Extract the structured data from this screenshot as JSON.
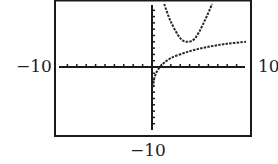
{
  "chart_data": {
    "type": "line",
    "title": "",
    "xlabel": "",
    "ylabel": "",
    "xlim": [
      -10,
      10
    ],
    "ylim": [
      -10,
      10
    ],
    "grid": false,
    "tick_spacing": 1,
    "window_labels": {
      "xmin": "−10",
      "xmax": "10",
      "ymin": "−10"
    },
    "series": [
      {
        "name": "upper curve (U-shaped, asymptotic at x=0)",
        "style": "dotted",
        "points": [
          [
            1.3,
            10
          ],
          [
            2.0,
            7.2
          ],
          [
            3.0,
            4.6
          ],
          [
            3.8,
            4.0
          ],
          [
            4.6,
            4.6
          ],
          [
            5.5,
            7.0
          ],
          [
            6.4,
            10
          ]
        ]
      },
      {
        "name": "lower curve (logarithmic)",
        "style": "dotted",
        "points": [
          [
            0.1,
            -3.2
          ],
          [
            0.3,
            -1.5
          ],
          [
            0.85,
            0
          ],
          [
            2,
            1.4
          ],
          [
            4,
            2.5
          ],
          [
            6,
            3.2
          ],
          [
            8,
            3.7
          ],
          [
            10,
            4.0
          ]
        ]
      }
    ]
  },
  "colors": {
    "frame": "#1a1a1a",
    "axes": "#1a1a1a",
    "curve": "#2a2a2a",
    "background": "#ffffff"
  }
}
